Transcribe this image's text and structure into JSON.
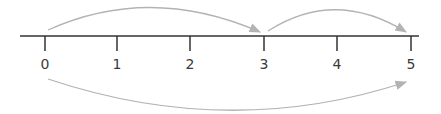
{
  "number_line": {
    "min": 0,
    "max": 5,
    "ticks": [
      {
        "value": 0,
        "label": "0",
        "x": 45
      },
      {
        "value": 1,
        "label": "1",
        "x": 117
      },
      {
        "value": 2,
        "label": "2",
        "x": 190
      },
      {
        "value": 3,
        "label": "3",
        "x": 264
      },
      {
        "value": 4,
        "label": "4",
        "x": 337
      },
      {
        "value": 5,
        "label": "5",
        "x": 411
      }
    ],
    "axis_color": "#333333",
    "arc_color": "#b3b3b3"
  },
  "jumps": [
    {
      "from": 0,
      "to": 3,
      "side": "above"
    },
    {
      "from": 3,
      "to": 5,
      "side": "above"
    },
    {
      "from": 0,
      "to": 5,
      "side": "below"
    }
  ]
}
